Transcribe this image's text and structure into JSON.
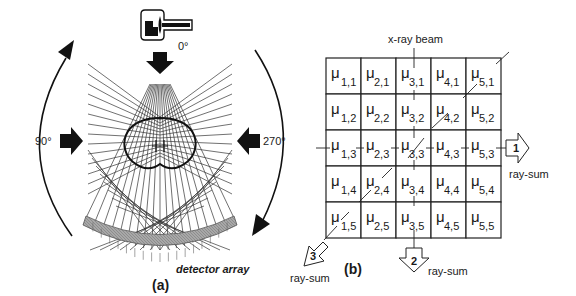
{
  "figure": {
    "panel_a": {
      "label": "(a)",
      "source_angle": "0°",
      "left_angle": "90°",
      "right_angle": "270°",
      "detector_label": "detector array",
      "icons": [
        "x-ray-tube-icon",
        "arrow-down-icon",
        "arrow-right-icon",
        "arrow-left-icon",
        "rotation-arc-ccw-icon",
        "rotation-arc-cw-icon"
      ]
    },
    "panel_b": {
      "label": "(b)",
      "beam_label": "x-ray beam",
      "symbol": "μ",
      "rows": [
        [
          "1,1",
          "2,1",
          "3,1",
          "4,1",
          "5,1"
        ],
        [
          "1,2",
          "2,2",
          "3,2",
          "4,2",
          "5,2"
        ],
        [
          "1,3",
          "2,3",
          "3,3",
          "4,3",
          "5,3"
        ],
        [
          "1,4",
          "2,4",
          "3,4",
          "4,4",
          "5,4"
        ],
        [
          "1,5",
          "2,5",
          "3,5",
          "4,5",
          "5,5"
        ]
      ],
      "ray_sums": [
        {
          "id": "1",
          "label": "ray-sum",
          "direction": "horizontal"
        },
        {
          "id": "2",
          "label": "ray-sum",
          "direction": "vertical"
        },
        {
          "id": "3",
          "label": "ray-sum",
          "direction": "diagonal"
        }
      ]
    }
  }
}
